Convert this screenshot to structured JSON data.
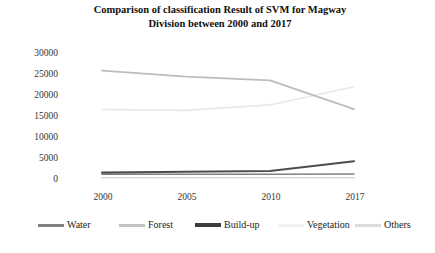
{
  "chart_data": {
    "type": "line",
    "title": "Comparison of classification Result of SVM for Magway Division between 2000 and 2017",
    "title_line1": "Comparison of classification Result of SVM for Magway",
    "title_line2": "Division between 2000 and 2017",
    "xlabel": "",
    "ylabel": "",
    "categories": [
      "2000",
      "2005",
      "2010",
      "2017"
    ],
    "x": [
      2000,
      2005,
      2010,
      2017
    ],
    "ylim": [
      0,
      30000
    ],
    "yticks": [
      0,
      5000,
      10000,
      15000,
      20000,
      25000,
      30000
    ],
    "ytick_labels": [
      "0",
      "5000",
      "10000",
      "15000",
      "20000",
      "25000",
      "30000"
    ],
    "grid": false,
    "legend_position": "bottom",
    "series": [
      {
        "name": "Water",
        "color": "#808080",
        "values": [
          1100,
          1100,
          1100,
          1200
        ]
      },
      {
        "name": "Forest",
        "color": "#bdbdbd",
        "values": [
          25600,
          24200,
          23300,
          16500
        ]
      },
      {
        "name": "Build-up",
        "color": "#4d4d4d",
        "values": [
          1500,
          1700,
          1900,
          4200
        ]
      },
      {
        "name": "Vegetation",
        "color": "#e8e8e8",
        "values": [
          16400,
          16200,
          17500,
          21800
        ]
      },
      {
        "name": "Others",
        "color": "#d6d6d6",
        "values": [
          300,
          300,
          300,
          300
        ]
      }
    ]
  },
  "legend": {
    "items": [
      {
        "label": "Water"
      },
      {
        "label": "Forest"
      },
      {
        "label": "Build-up"
      },
      {
        "label": "Vegetation"
      },
      {
        "label": "Others"
      }
    ]
  }
}
